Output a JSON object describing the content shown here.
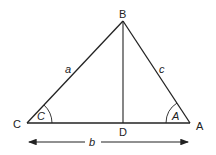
{
  "diagram": {
    "vertices": {
      "B": {
        "label": "B",
        "x": 123,
        "y": 21
      },
      "C": {
        "label": "C",
        "x": 27,
        "y": 123
      },
      "A": {
        "label": "A",
        "x": 190,
        "y": 123
      },
      "D": {
        "label": "D",
        "x": 123,
        "y": 123
      }
    },
    "sides": {
      "a": "a",
      "b": "b",
      "c": "c"
    },
    "angles": {
      "C": "C",
      "A": "A"
    },
    "colors": {
      "line": "#222222",
      "background": "#ffffff"
    }
  }
}
